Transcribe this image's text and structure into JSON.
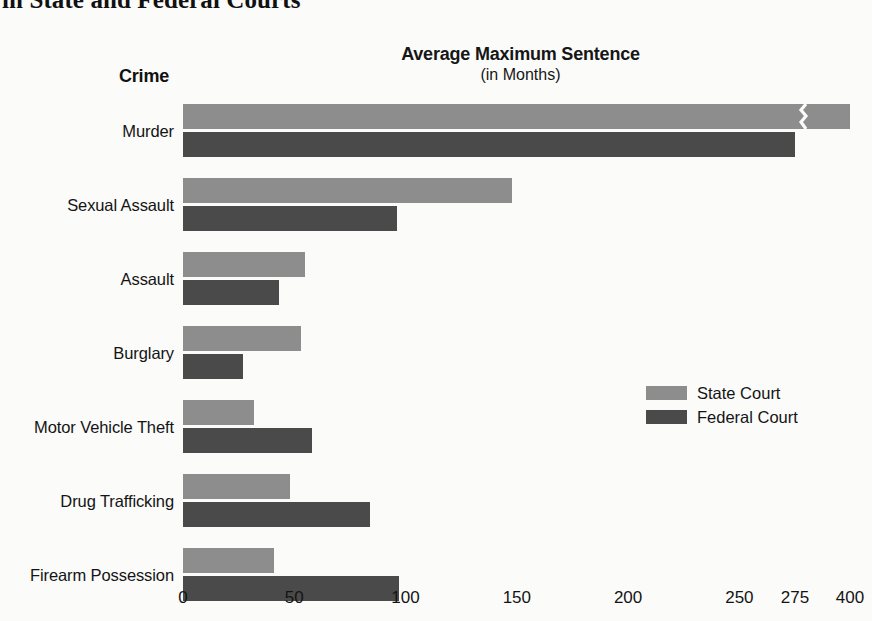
{
  "headline": "in State and Federal Courts",
  "crime_column_header": "Crime",
  "legend": {
    "items": [
      {
        "label": "State Court",
        "color": "#8d8d8d",
        "key": "state"
      },
      {
        "label": "Federal Court",
        "color": "#4a4a4a",
        "key": "federal"
      }
    ]
  },
  "chart_data": {
    "type": "bar",
    "orientation": "horizontal",
    "title": "Average Maximum Sentence",
    "subtitle": "(in Months)",
    "xlabel": "",
    "ylabel": "Crime",
    "grid": false,
    "legend_position": "middle-right",
    "axis_break": {
      "after": 275,
      "before": 400,
      "applies_to": "Murder / State Court"
    },
    "xlim": [
      0,
      400
    ],
    "xticks": [
      0,
      50,
      100,
      150,
      200,
      250,
      275,
      400
    ],
    "xticklabels": [
      "0",
      "50",
      "100",
      "150",
      "200",
      "250",
      "275",
      "400"
    ],
    "categories": [
      "Murder",
      "Sexual Assault",
      "Assault",
      "Burglary",
      "Motor Vehicle Theft",
      "Drug Trafficking",
      "Firearm Possession"
    ],
    "series": [
      {
        "name": "State Court",
        "color": "#8d8d8d",
        "values": [
          400,
          148,
          55,
          53,
          32,
          48,
          41
        ]
      },
      {
        "name": "Federal Court",
        "color": "#4a4a4a",
        "values": [
          275,
          96,
          43,
          27,
          58,
          84,
          97
        ]
      }
    ]
  }
}
